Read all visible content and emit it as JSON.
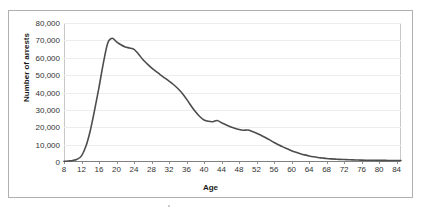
{
  "chart_data": {
    "type": "line",
    "title": "",
    "xlabel": "Age",
    "ylabel": "Number of arrests",
    "xlim": [
      8,
      85
    ],
    "ylim": [
      0,
      80000
    ],
    "grid": true,
    "legend": false,
    "line_color": "#4d4d4d",
    "gridline_color": "#ededed",
    "x_tick_labels": [
      "8",
      "12",
      "16",
      "20",
      "24",
      "28",
      "32",
      "36",
      "40",
      "44",
      "48",
      "52",
      "56",
      "60",
      "64",
      "68",
      "72",
      "76",
      "80",
      "84"
    ],
    "x_tick_values": [
      8,
      12,
      16,
      20,
      24,
      28,
      32,
      36,
      40,
      44,
      48,
      52,
      56,
      60,
      64,
      68,
      72,
      76,
      80,
      84
    ],
    "y_tick_labels": [
      "0",
      "10,000",
      "20,000",
      "30,000",
      "40,000",
      "50,000",
      "60,000",
      "70,000",
      "80,000"
    ],
    "y_tick_values": [
      0,
      10000,
      20000,
      30000,
      40000,
      50000,
      60000,
      70000,
      80000
    ],
    "x": [
      8,
      9,
      10,
      11,
      12,
      13,
      14,
      15,
      16,
      17,
      18,
      19,
      20,
      21,
      22,
      23,
      24,
      25,
      26,
      27,
      28,
      29,
      30,
      31,
      32,
      33,
      34,
      35,
      36,
      37,
      38,
      39,
      40,
      41,
      42,
      43,
      44,
      45,
      46,
      47,
      48,
      49,
      50,
      51,
      52,
      53,
      54,
      55,
      56,
      57,
      58,
      59,
      60,
      61,
      62,
      63,
      64,
      65,
      66,
      67,
      68,
      69,
      70,
      71,
      72,
      73,
      74,
      75,
      76,
      77,
      78,
      79,
      80,
      81,
      82,
      83,
      84,
      85
    ],
    "values": [
      400,
      600,
      900,
      1600,
      3500,
      9000,
      18000,
      30000,
      43000,
      57000,
      68500,
      71200,
      69200,
      67500,
      66200,
      65600,
      64800,
      62200,
      59000,
      56500,
      54200,
      52200,
      50200,
      48400,
      46600,
      44600,
      42300,
      39600,
      36200,
      32500,
      29000,
      26200,
      24200,
      23400,
      23200,
      23900,
      22600,
      21400,
      20300,
      19400,
      18700,
      18300,
      18400,
      17600,
      16600,
      15400,
      14100,
      12700,
      11200,
      9900,
      8700,
      7600,
      6500,
      5600,
      4800,
      4100,
      3500,
      3000,
      2600,
      2300,
      2000,
      1800,
      1650,
      1500,
      1400,
      1300,
      1200,
      1150,
      1100,
      1050,
      1000,
      980,
      950,
      920,
      900,
      880,
      860,
      850
    ]
  }
}
